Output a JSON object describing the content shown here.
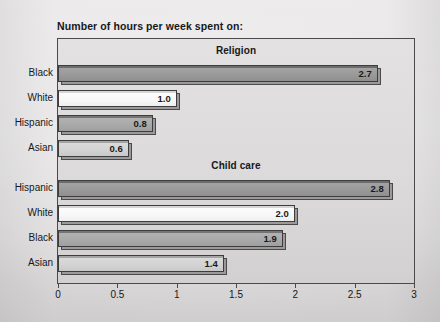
{
  "chart_data": {
    "type": "bar",
    "orientation": "horizontal",
    "title": "Number of hours per week spent on:",
    "xlabel": "",
    "ylabel": "",
    "xlim": [
      0,
      3
    ],
    "xticks": [
      "0",
      "0.5",
      "1",
      "1.5",
      "2",
      "2.5",
      "3"
    ],
    "xtick_values": [
      0,
      0.5,
      1,
      1.5,
      2,
      2.5,
      3
    ],
    "grid": false,
    "legend": "none",
    "panels": [
      {
        "header": "Religion",
        "categories": [
          "Black",
          "White",
          "Hispanic",
          "Asian"
        ],
        "values": [
          2.7,
          1.0,
          0.8,
          0.6
        ],
        "labels": [
          "2.7",
          "1.0",
          "0.8",
          "0.6"
        ],
        "fills": [
          "dark",
          "white",
          "medium",
          "light"
        ]
      },
      {
        "header": "Child care",
        "categories": [
          "Hispanic",
          "White",
          "Black",
          "Asian"
        ],
        "values": [
          2.8,
          2.0,
          1.9,
          1.4
        ],
        "labels": [
          "2.8",
          "2.0",
          "1.9",
          "1.4"
        ],
        "fills": [
          "dark",
          "white",
          "medium",
          "light"
        ]
      }
    ]
  },
  "colors": {
    "page_background": "#e4e2e2",
    "plot_background": "#dddbdb",
    "bar_outline": "#3d3d3d",
    "bar_shadow": "#9a9a9a",
    "text": "#17181a",
    "fill_dark": "#9b9b9b",
    "fill_white": "#f8f8f8",
    "fill_medium": "#aaaaaa",
    "fill_light": "#d4d4d4"
  }
}
